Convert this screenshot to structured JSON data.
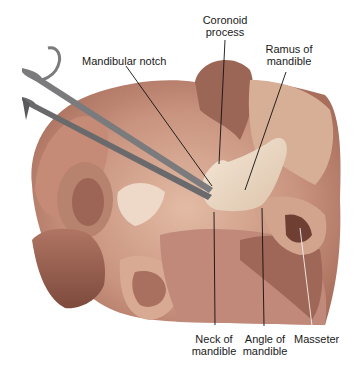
{
  "figure": {
    "type": "anatomical-dissection-photo",
    "colors": {
      "background": "#ffffff",
      "tissue_light": "#e8c9b4",
      "tissue_mid": "#c9977f",
      "tissue_dark": "#8a5646",
      "bone": "#efdfcc",
      "instrument": "#6f6f72",
      "leader_line": "#111111"
    }
  },
  "labels": {
    "mandibular_notch": {
      "line1": "Mandibular notch"
    },
    "coronoid_process": {
      "line1": "Coronoid",
      "line2": "process"
    },
    "ramus_of_mandible": {
      "line1": "Ramus of",
      "line2": "mandible"
    },
    "neck_of_mandible": {
      "line1": "Neck of",
      "line2": "mandible"
    },
    "angle_of_mandible": {
      "line1": "Angle of",
      "line2": "mandible"
    },
    "masseter": {
      "line1": "Masseter"
    }
  }
}
